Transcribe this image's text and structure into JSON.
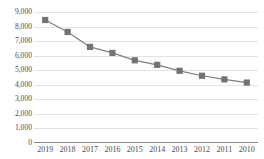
{
  "chart_data": {
    "type": "line",
    "title": "",
    "xlabel": "",
    "ylabel": "",
    "categories": [
      "2019",
      "2018",
      "2017",
      "2016",
      "2015",
      "2014",
      "2013",
      "2012",
      "2011",
      "2010"
    ],
    "series": [
      {
        "name": "series-1",
        "values": [
          8450,
          7630,
          6600,
          6190,
          5680,
          5370,
          4960,
          4620,
          4370,
          4150
        ]
      }
    ],
    "ylim": [
      0,
      9000
    ],
    "ytick_values": [
      0,
      1000,
      2000,
      3000,
      4000,
      5000,
      6000,
      7000,
      8000,
      9000
    ],
    "ytick_labels": [
      "0",
      "1,000",
      "2,000",
      "3,000",
      "4,000",
      "5,000",
      "6,000",
      "7,000",
      "8,000",
      "9,000"
    ],
    "grid": true,
    "legend": "none",
    "colors": {
      "line": "#7f7f7f",
      "marker": "#737373",
      "gridline": "#e3e3e3",
      "axis": "#8a8a8a",
      "tick_label": "#4a4a4a",
      "background": "#ffffff"
    },
    "marker_style": "square",
    "marker_size": 3.1,
    "line_width": 1.2
  }
}
